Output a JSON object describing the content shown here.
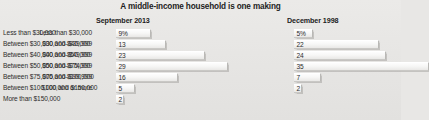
{
  "chart_data": {
    "type": "bar",
    "title": "A middle-income household is one making",
    "orientation": "horizontal",
    "xlabel": "",
    "ylabel": "",
    "grid": false,
    "legend": "none",
    "value_unit": "percent",
    "panels": [
      {
        "name": "september-2013",
        "header": "September 2013",
        "categories": [
          "Less than $30,000",
          "Between $30,000 and $40,000",
          "Between $40,000 and $50,000",
          "Between $50,000 and $75,000",
          "Between $75,000 and $100,000",
          "Between $100,000 and $150,000",
          "More than $150,000"
        ],
        "values": [
          9,
          13,
          23,
          29,
          16,
          5,
          2
        ],
        "value_labels": [
          "9%",
          "13",
          "23",
          "29",
          "16",
          "5",
          "2"
        ]
      },
      {
        "name": "december-1998",
        "header": "December 1998",
        "categories": [
          "Less than $30,000",
          "$30,000–$39,999",
          "$40,000–$49,999",
          "$50,000–$74,999",
          "$75,000–$99,999",
          "$100,000 or more"
        ],
        "values": [
          5,
          22,
          24,
          35,
          7,
          2
        ],
        "value_labels": [
          "5%",
          "22",
          "24",
          "35",
          "7",
          "2"
        ]
      }
    ]
  },
  "colors": {
    "background": "#e8e7e5",
    "text": "#2a2a2a",
    "bar_fill": "#fafafa",
    "bar_edge": "#b9b8b5"
  }
}
